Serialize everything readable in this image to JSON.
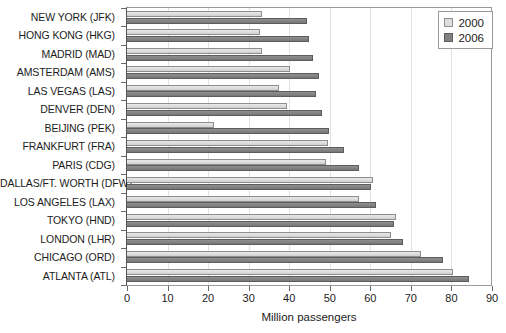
{
  "chart_data": {
    "type": "bar",
    "orientation": "horizontal",
    "title": "",
    "xlabel": "Million passengers",
    "ylabel": "",
    "xlim": [
      0,
      90
    ],
    "xticks": [
      0,
      10,
      20,
      30,
      40,
      50,
      60,
      70,
      80,
      90
    ],
    "grid": true,
    "legend_position": "top-right",
    "categories": [
      "NEW YORK (JFK)",
      "HONG KONG (HKG)",
      "MADRID (MAD)",
      "AMSTERDAM (AMS)",
      "LAS VEGAS (LAS)",
      "DENVER (DEN)",
      "BEIJING (PEK)",
      "FRANKFURT (FRA)",
      "PARIS (CDG)",
      "DALLAS/FT. WORTH (DFW)",
      "LOS ANGELES (LAX)",
      "TOKYO (HND)",
      "LONDON (LHR)",
      "CHICAGO (ORD)",
      "ATLANTA (ATL)"
    ],
    "series": [
      {
        "name": "2000",
        "color": "#dedede",
        "values": [
          33.2,
          32.7,
          33.2,
          40.1,
          37.4,
          39.4,
          21.4,
          49.5,
          49.0,
          60.7,
          57.2,
          66.3,
          65.1,
          72.5,
          80.4
        ]
      },
      {
        "name": "2006",
        "color": "#828282",
        "values": [
          44.3,
          44.8,
          45.8,
          47.3,
          46.5,
          48.0,
          49.8,
          53.5,
          57.2,
          60.2,
          61.4,
          65.8,
          68.0,
          77.9,
          84.3
        ]
      }
    ]
  },
  "legend": {
    "items": [
      {
        "label": "2000",
        "swatch": "light-gray-square"
      },
      {
        "label": "2006",
        "swatch": "dark-gray-square"
      }
    ]
  }
}
